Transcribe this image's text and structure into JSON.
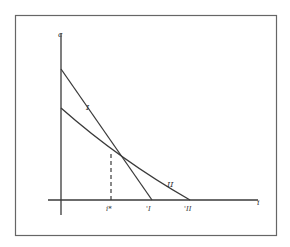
{
  "diagram": {
    "y_axis_label": "c",
    "x_axis_label": "i",
    "curve_I_label": "I",
    "curve_II_label": "II",
    "tick_istar_label": "i*",
    "tick_I_label": "'I",
    "tick_II_label": "'II"
  },
  "colors": {
    "line": "#3a3a3a",
    "frame": "#555555",
    "background": "#ffffff"
  }
}
